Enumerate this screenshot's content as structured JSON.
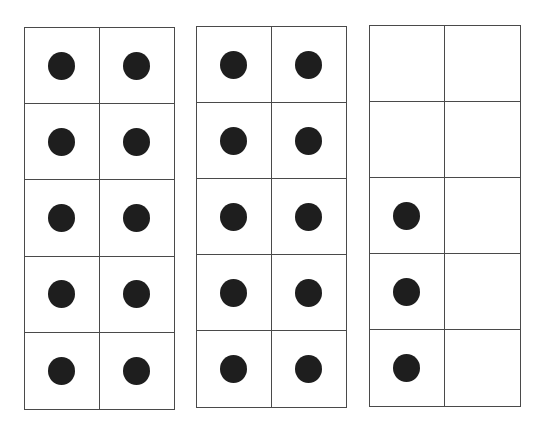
{
  "diagram": {
    "type": "ten-frames",
    "counter_color": "#1e1e1e",
    "line_color": "#4a4a4a",
    "frames": [
      {
        "id": "frame-1",
        "filled": 10,
        "cells": [
          1,
          1,
          1,
          1,
          1,
          1,
          1,
          1,
          1,
          1
        ]
      },
      {
        "id": "frame-2",
        "filled": 10,
        "cells": [
          1,
          1,
          1,
          1,
          1,
          1,
          1,
          1,
          1,
          1
        ]
      },
      {
        "id": "frame-3",
        "filled": 3,
        "cells": [
          0,
          0,
          0,
          0,
          1,
          0,
          1,
          0,
          1,
          0
        ]
      }
    ],
    "total_counters": 23
  }
}
